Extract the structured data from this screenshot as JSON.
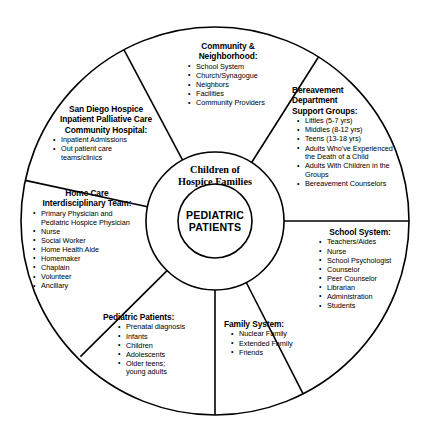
{
  "diagram": {
    "center": {
      "middle_ring_label_line1": "Children of",
      "middle_ring_label_line2": "Hospice Families",
      "inner_circle_label_line1": "PEDIATRIC",
      "inner_circle_label_line2": "PATIENTS"
    },
    "sectors": [
      {
        "id": "community",
        "title_line1": "Community &",
        "title_line2": "Neighborhood:",
        "items": [
          "School System",
          "Church/Synagogue",
          "Neighbors",
          "Facilities",
          "Community Providers"
        ]
      },
      {
        "id": "bereavement",
        "title_line1": "Bereavement",
        "title_line2": "Department",
        "title_line3": "Support Groups:",
        "items": [
          "Littles (5-7 yrs)",
          "Middles (8-12 yrs)",
          "Teens (13-18 yrs)",
          "Adults Who've Experienced",
          "Adults With Children in the",
          "Bereavement Counselors"
        ],
        "item_continuations": {
          "3": "the Death of a Child",
          "4": "Groups"
        }
      },
      {
        "id": "hospice",
        "title_line1": "San Diego Hospice",
        "title_line2": "Inpatient Palliative Care",
        "title_line3": "Community Hospital:",
        "items": [
          "Inpatient Admissions",
          "Out patient care"
        ],
        "item_continuations": {
          "1": "teams/clinics"
        }
      },
      {
        "id": "homecare",
        "title_line1": "Home Care",
        "title_line2": "Interdisciplinary Team:",
        "items": [
          "Primary Physician and",
          "Nurse",
          "Social Worker",
          "Home Health Aide",
          "Homemaker",
          "Chaplain",
          "Volunteer",
          "Ancillary"
        ],
        "item_continuations": {
          "0": "Pediatric Hospice Physician"
        }
      },
      {
        "id": "school",
        "title_line1": "School System:",
        "items": [
          "Teachers/Aides",
          "Nurse",
          "School Psychologist",
          "Counselor",
          "Peer Counselor",
          "Librarian",
          "Administration",
          "Students"
        ]
      },
      {
        "id": "pediatric",
        "title_line1": "Pediatric Patients:",
        "items": [
          "Prenatal diagnosis",
          "Infants",
          "Children",
          "Adolescents",
          "Older teens;"
        ],
        "item_continuations": {
          "4": "young adults"
        }
      },
      {
        "id": "family",
        "title_line1": "Family System:",
        "items": [
          "Nuclear Family",
          "Extended Family",
          "Friends"
        ]
      }
    ],
    "style": {
      "line_color": "#000000",
      "background_color": "#ffffff"
    }
  }
}
